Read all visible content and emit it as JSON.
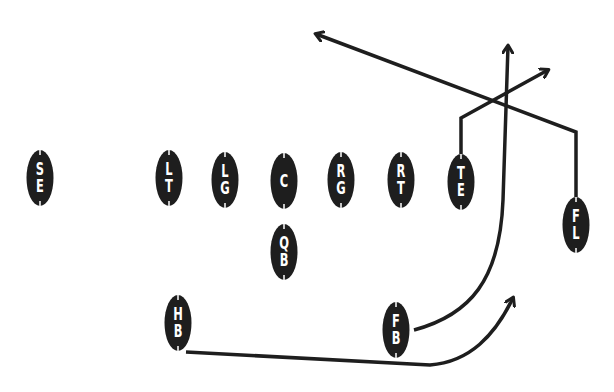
{
  "diagram": {
    "type": "football-play",
    "ink_color": "#1e1e1e",
    "background": "#ffffff",
    "players": [
      {
        "id": "SE",
        "l1": "S",
        "l2": "E",
        "x": 40,
        "y": 178
      },
      {
        "id": "LT",
        "l1": "L",
        "l2": "T",
        "x": 169,
        "y": 178
      },
      {
        "id": "LG",
        "l1": "L",
        "l2": "G",
        "x": 225,
        "y": 180
      },
      {
        "id": "C",
        "l1": "C",
        "l2": "",
        "x": 284,
        "y": 181
      },
      {
        "id": "RG",
        "l1": "R",
        "l2": "G",
        "x": 341,
        "y": 180
      },
      {
        "id": "RT",
        "l1": "R",
        "l2": "T",
        "x": 401,
        "y": 180
      },
      {
        "id": "TE",
        "l1": "T",
        "l2": "E",
        "x": 461,
        "y": 182
      },
      {
        "id": "FL",
        "l1": "F",
        "l2": "L",
        "x": 576,
        "y": 225
      },
      {
        "id": "QB",
        "l1": "Q",
        "l2": "B",
        "x": 284,
        "y": 252
      },
      {
        "id": "HB",
        "l1": "H",
        "l2": "B",
        "x": 178,
        "y": 323
      },
      {
        "id": "FB",
        "l1": "F",
        "l2": "B",
        "x": 396,
        "y": 330
      }
    ],
    "routes": [
      {
        "from": "FL",
        "name": "post-corner-across",
        "path": "M 576 197 L 576 132 L 316 34",
        "arrow": true
      },
      {
        "from": "TE",
        "name": "corner",
        "path": "M 461 154 L 461 118 L 548 70",
        "arrow": true
      },
      {
        "from": "FB",
        "name": "wheel-up",
        "path": "M 414 330 C 470 315 500 280 503 200 L 508 46",
        "arrow": true
      },
      {
        "from": "HB",
        "name": "swing",
        "path": "M 186 352 L 430 365 C 470 362 495 335 513 298",
        "arrow": true
      }
    ]
  }
}
